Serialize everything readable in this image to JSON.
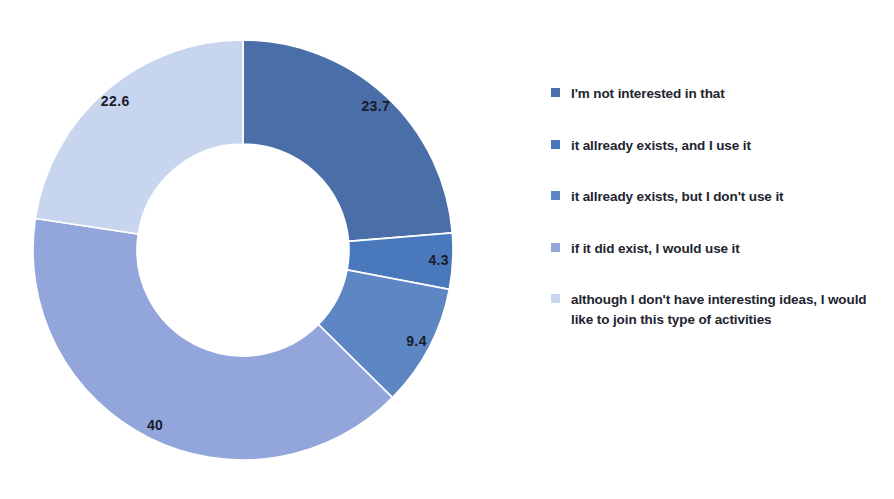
{
  "chart_data": {
    "type": "pie",
    "variant": "donut",
    "title": "",
    "xlabel": "",
    "ylabel": "",
    "grid": false,
    "legend_position": "right",
    "start_angle_deg": 0,
    "direction": "clockwise",
    "total": 100,
    "categories": [
      "I'm not interested in that",
      "it allready exists, and I use it",
      "it allready exists, but I don't use it",
      "if it did exist, I would use it",
      "although I don't have interesting ideas, I would like to join this type of activities"
    ],
    "values": [
      23.7,
      4.3,
      9.4,
      40,
      22.6
    ],
    "value_labels": [
      "23.7",
      "4.3",
      "9.4",
      "40",
      "22.6"
    ],
    "colors": [
      "#4a6ea8",
      "#4a78bd",
      "#5d86c4",
      "#93a6dc",
      "#c8d5ef"
    ],
    "slices": [
      {
        "label": "I'm not interested in that",
        "value": 23.7,
        "display": "23.7",
        "color": "#4a6ea8"
      },
      {
        "label": "it allready exists, and I use it",
        "value": 4.3,
        "display": "4.3",
        "color": "#4a78bd"
      },
      {
        "label": "it allready exists, but I don't use it",
        "value": 9.4,
        "display": "9.4",
        "color": "#5d86c4"
      },
      {
        "label": "if it did exist, I would use it",
        "value": 40,
        "display": "40",
        "color": "#93a6dc"
      },
      {
        "label": "although I don't have interesting ideas, I would like to join this type of activities",
        "value": 22.6,
        "display": "22.6",
        "color": "#c8d5ef"
      }
    ]
  },
  "legend": {
    "items": [
      {
        "label": "I'm not interested in that",
        "color": "#4a6ea8"
      },
      {
        "label": "it allready exists, and I use it",
        "color": "#4a78bd"
      },
      {
        "label": "it allready exists, but I don't use it",
        "color": "#5d86c4"
      },
      {
        "label": "if it did exist, I would use it",
        "color": "#93a6dc"
      },
      {
        "label": "although I don't have interesting ideas, I would like to join this type of activities",
        "color": "#c8d5ef"
      }
    ]
  }
}
